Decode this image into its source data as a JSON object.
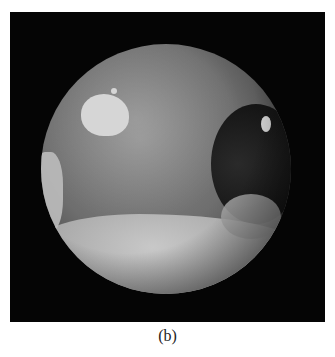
{
  "figure": {
    "caption": "(b)",
    "image_description": "Rendered grayscale planet sphere (Mars-like) with lighter landmasses in the lower half, a bright polar-like cap in upper left, and small bright patches on the dark right limb, on a black background",
    "background_color": "#050505",
    "page_color": "#ffffff"
  }
}
